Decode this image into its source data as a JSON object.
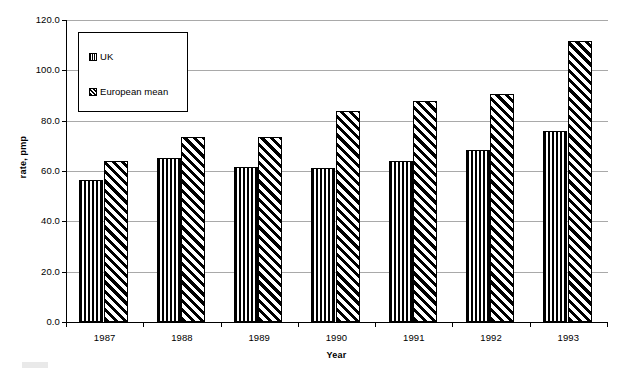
{
  "chart_data": {
    "type": "bar",
    "title": "",
    "xlabel": "Year",
    "ylabel": "rate, pmp",
    "categories": [
      "1987",
      "1988",
      "1989",
      "1990",
      "1991",
      "1992",
      "1993"
    ],
    "series": [
      {
        "name": "UK",
        "pattern": "vertical-stripes",
        "values": [
          56.5,
          65.0,
          61.5,
          61.0,
          64.0,
          68.5,
          76.0
        ]
      },
      {
        "name": "European mean",
        "pattern": "diagonal-hatch",
        "values": [
          64.0,
          73.5,
          73.5,
          84.0,
          88.0,
          90.5,
          111.5
        ]
      }
    ],
    "ylim": [
      0.0,
      120.0
    ],
    "ytick_step": 20.0,
    "ytick_labels": [
      "120.0",
      "100.0",
      "80.0",
      "60.0",
      "40.0",
      "20.0",
      "0.0"
    ],
    "ytick_values": [
      120.0,
      100.0,
      80.0,
      60.0,
      40.0,
      20.0,
      0.0
    ],
    "grid": true,
    "legend_position": "upper-left-inside",
    "colors": {
      "bar_outline": "#000000",
      "bar_fill": "#ffffff",
      "gridline": "#a9a9a9",
      "axis": "#000000",
      "background": "#ffffff"
    }
  },
  "legend": {
    "entries": [
      {
        "label": "UK",
        "swatch": "vertical-stripes"
      },
      {
        "label": "European mean",
        "swatch": "diagonal-hatch"
      }
    ]
  }
}
